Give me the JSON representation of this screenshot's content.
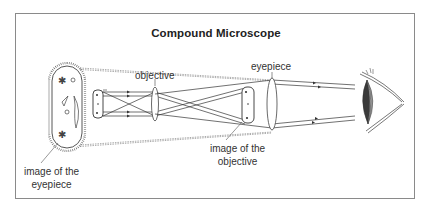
{
  "title": "Compound Microscope",
  "labels": {
    "objective": "objective",
    "eyepiece": "eyepiece",
    "image_of_objective_line1": "image of the",
    "image_of_objective_line2": "objective",
    "image_of_eyepiece_line1": "image of the",
    "image_of_eyepiece_line2": "eyepiece"
  },
  "colors": {
    "line": "#444444",
    "dashed": "#888888",
    "frame": "#8a8a8a",
    "eye_lens_dark": "#3a3a3a",
    "eye_lens_light": "#9a9a9a"
  }
}
